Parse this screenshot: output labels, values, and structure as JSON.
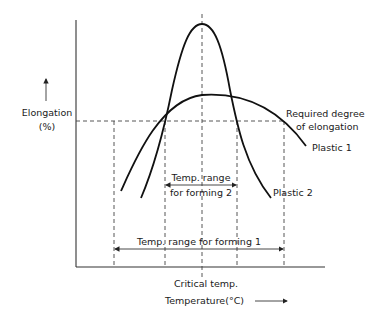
{
  "diagram": {
    "y_axis": {
      "label": "Elongation",
      "unit": "(%)"
    },
    "x_axis": {
      "label": "Temperature(°C)",
      "marker_label": "Critical temp."
    },
    "threshold": {
      "label_line1": "Required degree",
      "label_line2": "of elongation"
    },
    "curves": [
      {
        "name": "Plastic 1",
        "shape": "broad low arch"
      },
      {
        "name": "Plastic 2",
        "shape": "narrow tall peak"
      }
    ],
    "ranges": {
      "forming2": {
        "line1": "Temp. range",
        "line2": "for forming 2"
      },
      "forming1": {
        "label": "Temp. range for forming 1"
      }
    },
    "colors": {
      "line": "#111111",
      "background": "#ffffff"
    }
  }
}
